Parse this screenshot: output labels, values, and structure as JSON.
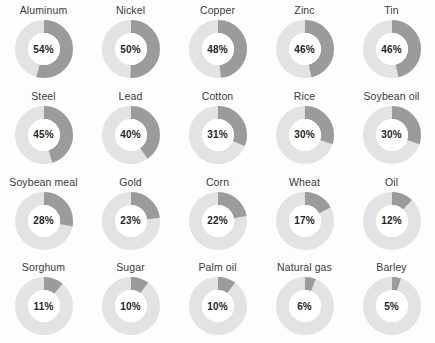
{
  "chart_data": {
    "type": "pie",
    "title": "",
    "subtitle": "",
    "xlabel": "",
    "ylabel": "",
    "legend_position": "none",
    "grid": false,
    "layout": {
      "columns": 5,
      "rows": 4
    },
    "value_suffix": "%",
    "max_value": 100,
    "arc_start": "12 o'clock",
    "arc_direction": "clockwise",
    "colors": {
      "track": "#e3e3e3",
      "arc": "#9b9b9b",
      "hole": "#ffffff",
      "label_text": "#3b3b3b",
      "value_text": "#262626",
      "background": "#fdfdfd"
    },
    "categories": [
      "Aluminum",
      "Nickel",
      "Copper",
      "Zinc",
      "Tin",
      "Steel",
      "Lead",
      "Cotton",
      "Rice",
      "Soybean oil",
      "Soybean meal",
      "Gold",
      "Corn",
      "Wheat",
      "Oil",
      "Sorghum",
      "Sugar",
      "Palm oil",
      "Natural gas",
      "Barley"
    ],
    "values": [
      54,
      50,
      48,
      46,
      46,
      45,
      40,
      31,
      30,
      30,
      28,
      23,
      22,
      17,
      12,
      11,
      10,
      10,
      6,
      5
    ],
    "items": [
      {
        "label": "Aluminum",
        "value": 54,
        "value_text": "54%"
      },
      {
        "label": "Nickel",
        "value": 50,
        "value_text": "50%"
      },
      {
        "label": "Copper",
        "value": 48,
        "value_text": "48%"
      },
      {
        "label": "Zinc",
        "value": 46,
        "value_text": "46%"
      },
      {
        "label": "Tin",
        "value": 46,
        "value_text": "46%"
      },
      {
        "label": "Steel",
        "value": 45,
        "value_text": "45%"
      },
      {
        "label": "Lead",
        "value": 40,
        "value_text": "40%"
      },
      {
        "label": "Cotton",
        "value": 31,
        "value_text": "31%"
      },
      {
        "label": "Rice",
        "value": 30,
        "value_text": "30%"
      },
      {
        "label": "Soybean oil",
        "value": 30,
        "value_text": "30%"
      },
      {
        "label": "Soybean meal",
        "value": 28,
        "value_text": "28%"
      },
      {
        "label": "Gold",
        "value": 23,
        "value_text": "23%"
      },
      {
        "label": "Corn",
        "value": 22,
        "value_text": "22%"
      },
      {
        "label": "Wheat",
        "value": 17,
        "value_text": "17%"
      },
      {
        "label": "Oil",
        "value": 12,
        "value_text": "12%"
      },
      {
        "label": "Sorghum",
        "value": 11,
        "value_text": "11%"
      },
      {
        "label": "Sugar",
        "value": 10,
        "value_text": "10%"
      },
      {
        "label": "Palm oil",
        "value": 10,
        "value_text": "10%"
      },
      {
        "label": "Natural gas",
        "value": 6,
        "value_text": "6%"
      },
      {
        "label": "Barley",
        "value": 5,
        "value_text": "5%"
      }
    ]
  }
}
